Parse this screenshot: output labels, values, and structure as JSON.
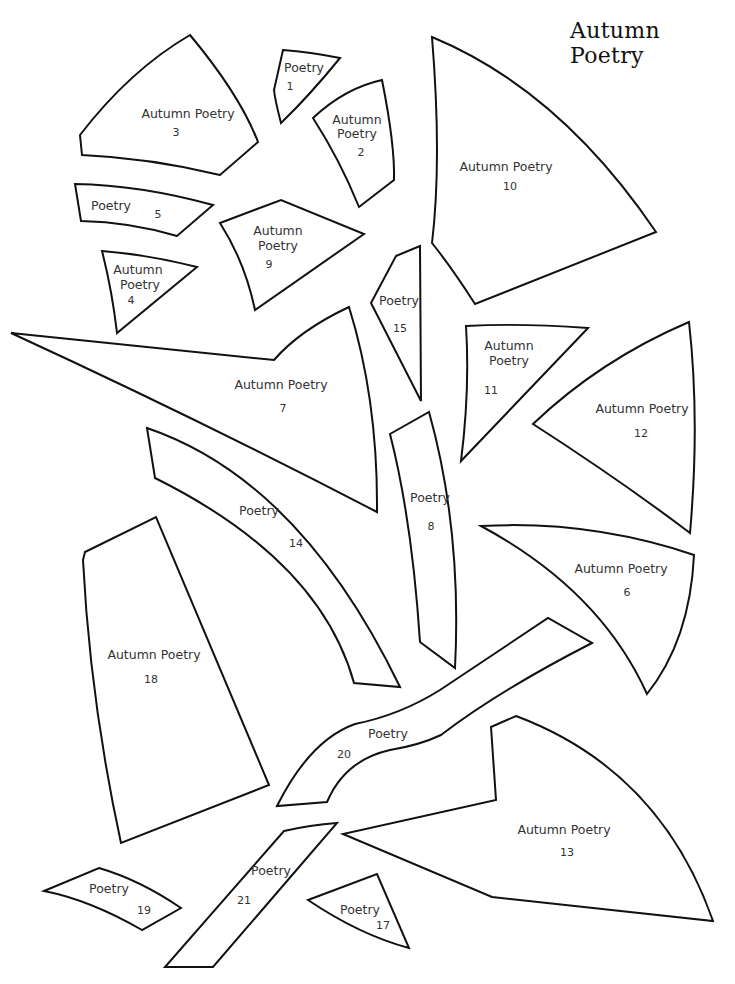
{
  "title": "Autumn Poetry",
  "colors": {
    "outline": "#111111",
    "text": "#333333",
    "background": "#ffffff"
  },
  "pieces": {
    "p1": {
      "label": [
        "Poetry"
      ],
      "number": "1"
    },
    "p2": {
      "label": [
        "Autumn",
        "Poetry"
      ],
      "number": "2"
    },
    "p3": {
      "label": [
        "Autumn Poetry"
      ],
      "number": "3"
    },
    "p4": {
      "label": [
        "Autumn",
        "Poetry"
      ],
      "number": "4"
    },
    "p5": {
      "label": [
        "Poetry"
      ],
      "number": "5"
    },
    "p6": {
      "label": [
        "Autumn Poetry"
      ],
      "number": "6"
    },
    "p7": {
      "label": [
        "Autumn Poetry"
      ],
      "number": "7"
    },
    "p8": {
      "label": [
        "Poetry"
      ],
      "number": "8"
    },
    "p9": {
      "label": [
        "Autumn",
        "Poetry"
      ],
      "number": "9"
    },
    "p10": {
      "label": [
        "Autumn Poetry"
      ],
      "number": "10"
    },
    "p11": {
      "label": [
        "Autumn",
        "Poetry"
      ],
      "number": "11"
    },
    "p12": {
      "label": [
        "Autumn Poetry"
      ],
      "number": "12"
    },
    "p13": {
      "label": [
        "Autumn Poetry"
      ],
      "number": "13"
    },
    "p14": {
      "label": [
        "Poetry"
      ],
      "number": "14"
    },
    "p15": {
      "label": [
        "Poetry"
      ],
      "number": "15"
    },
    "p17": {
      "label": [
        "Poetry"
      ],
      "number": "17"
    },
    "p18": {
      "label": [
        "Autumn Poetry"
      ],
      "number": "18"
    },
    "p19": {
      "label": [
        "Poetry"
      ],
      "number": "19"
    },
    "p20": {
      "label": [
        "Poetry"
      ],
      "number": "20"
    },
    "p21": {
      "label": [
        "Poetry"
      ],
      "number": "21"
    }
  }
}
